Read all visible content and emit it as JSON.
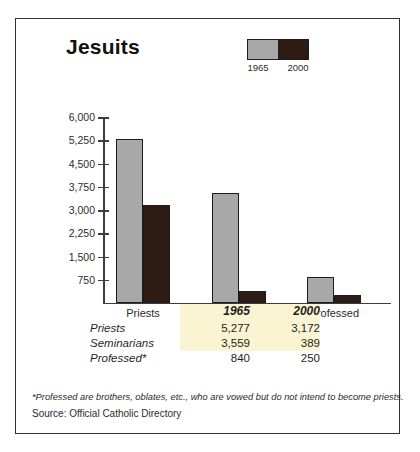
{
  "figure": {
    "title": "Jesuits",
    "footnote": "*Professed are brothers, oblates, etc., who are vowed but do not intend to become priests.",
    "source": "Source: Official Catholic Directory"
  },
  "legend": {
    "series_1_label": "1965",
    "series_2_label": "2000"
  },
  "colors": {
    "series_1965": "#a8a8a8",
    "series_2000": "#2e1b14",
    "bar_outline": "#1c1c1c",
    "axis": "#3d3d3d",
    "highlight": "#faf4d2",
    "border": "#333333"
  },
  "table": {
    "col_header_1": "1965",
    "col_header_2": "2000",
    "rows": [
      {
        "label": "Priests",
        "v1965": "5,277",
        "v2000": "3,172",
        "highlight": true
      },
      {
        "label": "Seminarians",
        "v1965": "3,559",
        "v2000": "389",
        "highlight": true
      },
      {
        "label": "Professed*",
        "v1965": "840",
        "v2000": "250",
        "highlight": false
      }
    ]
  },
  "chart_data": {
    "type": "bar",
    "title": "Jesuits",
    "xlabel": "",
    "ylabel": "",
    "categories": [
      "Priests",
      "Seminarians",
      "Professed"
    ],
    "series": [
      {
        "name": "1965",
        "color": "#a8a8a8",
        "values": [
          5277,
          3559,
          840
        ]
      },
      {
        "name": "2000",
        "color": "#2e1b14",
        "values": [
          3172,
          389,
          250
        ]
      }
    ],
    "ylim": [
      0,
      6000
    ],
    "yticks": [
      750,
      1500,
      2250,
      3000,
      3750,
      4500,
      5250,
      6000
    ],
    "ytick_labels": [
      "750",
      "1,500",
      "2,250",
      "3,000",
      "3,750",
      "4,500",
      "5,250",
      "6,000"
    ],
    "grid": false,
    "legend_position": "upper-right-inside"
  }
}
